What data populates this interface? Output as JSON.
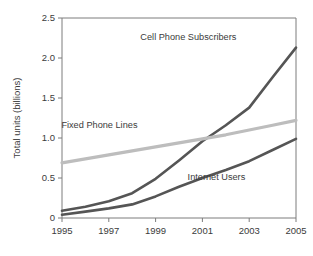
{
  "chart_data": {
    "type": "line",
    "title": "",
    "xlabel": "",
    "ylabel": "Total units (billions)",
    "xlim": [
      1995,
      2005
    ],
    "ylim": [
      0,
      2.5
    ],
    "grid": false,
    "legend_position": "inline-annotations",
    "x": [
      1995,
      1996,
      1997,
      1998,
      1999,
      2000,
      2001,
      2002,
      2003,
      2004,
      2005
    ],
    "xticks": [
      "1995",
      "1997",
      "1999",
      "2001",
      "2003",
      "2005"
    ],
    "xtick_values": [
      1995,
      1997,
      1999,
      2001,
      2003,
      2005
    ],
    "yticks": [
      "0",
      "0.5",
      "1.0",
      "1.5",
      "2.0",
      "2.5"
    ],
    "ytick_values": [
      0,
      0.5,
      1.0,
      1.5,
      2.0,
      2.5
    ],
    "series": [
      {
        "name": "Cell Phone Subscribers",
        "color": "#555555",
        "values": [
          0.09,
          0.14,
          0.21,
          0.31,
          0.49,
          0.72,
          0.96,
          1.16,
          1.38,
          1.76,
          2.13
        ],
        "label_x": 2000.4,
        "label_y": 2.23
      },
      {
        "name": "Fixed Phone Lines",
        "color": "#bdbdbd",
        "values": [
          0.69,
          0.74,
          0.79,
          0.84,
          0.89,
          0.94,
          0.99,
          1.04,
          1.1,
          1.16,
          1.22
        ],
        "label_x": 1996.6,
        "label_y": 1.12
      },
      {
        "name": "Internet Users",
        "color": "#555555",
        "values": [
          0.04,
          0.08,
          0.12,
          0.17,
          0.27,
          0.39,
          0.5,
          0.6,
          0.71,
          0.85,
          0.99
        ],
        "label_x": 2001.6,
        "label_y": 0.47
      }
    ]
  }
}
